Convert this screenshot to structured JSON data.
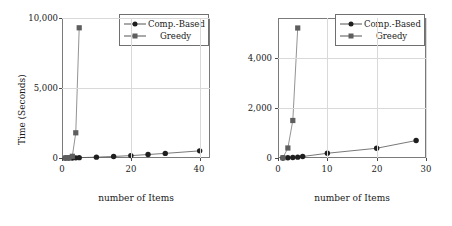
{
  "figure": {
    "axis_x_title": "number of Items",
    "axis_y_title": "Time (Seconds)",
    "legend": {
      "comp_label": "Comp.-Based",
      "greedy_label": "Greedy",
      "comp_marker": "circle-marker-icon",
      "greedy_marker": "square-marker-icon"
    },
    "colors": {
      "comp_series": "#1f1f1f",
      "greedy_series": "#5e5e5e",
      "axis": "#7a7a7a",
      "grid": "#d9d9d9"
    }
  },
  "chart_data": [
    {
      "type": "line",
      "title": "",
      "xlabel": "number of Items",
      "ylabel": "Time (Seconds)",
      "xlim": [
        0,
        43
      ],
      "ylim": [
        0,
        10000
      ],
      "xticks": [
        0,
        20,
        40
      ],
      "xticklabels": [
        "0",
        "20",
        "40"
      ],
      "yticks": [
        0,
        5000,
        10000
      ],
      "yticklabels": [
        "0",
        "5,000",
        "10,000"
      ],
      "grid": true,
      "legend_position": "top-right",
      "series": [
        {
          "name": "Comp.-Based",
          "marker": "circle",
          "x": [
            1,
            2,
            3,
            4,
            5,
            10,
            15,
            20,
            25,
            30,
            40
          ],
          "values": [
            1,
            2,
            5,
            12,
            25,
            60,
            110,
            170,
            250,
            330,
            510
          ]
        },
        {
          "name": "Greedy",
          "marker": "square",
          "x": [
            1,
            2,
            3,
            4,
            5
          ],
          "values": [
            2,
            20,
            120,
            1800,
            9300
          ]
        }
      ]
    },
    {
      "type": "line",
      "title": "",
      "xlabel": "number of Items",
      "ylabel": "",
      "xlim": [
        0,
        30
      ],
      "ylim": [
        0,
        5600
      ],
      "xticks": [
        0,
        10,
        20,
        30
      ],
      "xticklabels": [
        "0",
        "10",
        "20",
        "30"
      ],
      "yticks": [
        0,
        2000,
        4000
      ],
      "yticklabels": [
        "0",
        "2,000",
        "4,000"
      ],
      "grid": true,
      "legend_position": "top-right",
      "series": [
        {
          "name": "Comp.-Based",
          "marker": "circle",
          "x": [
            1,
            2,
            3,
            4,
            5,
            10,
            20,
            28
          ],
          "values": [
            3,
            8,
            18,
            35,
            60,
            190,
            390,
            700
          ]
        },
        {
          "name": "Greedy",
          "marker": "square",
          "x": [
            1,
            2,
            3,
            4
          ],
          "values": [
            10,
            400,
            1500,
            5200
          ]
        }
      ]
    }
  ]
}
